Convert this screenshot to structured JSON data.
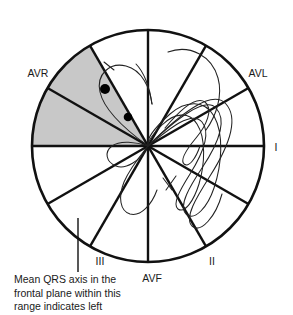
{
  "figure": {
    "type": "hexaxial-reference-diagram",
    "title_visible": false,
    "colors": {
      "line": "#111111",
      "shaded_wedge": "#c8c8c8",
      "trace": "#222222",
      "background": "#ffffff",
      "text": "#1a1a1a"
    },
    "circle": {
      "cx": 148,
      "cy": 146,
      "r": 116
    },
    "lead_labels": [
      {
        "id": "avr",
        "text": "AVR",
        "x": 38,
        "y": 77,
        "anchor": "middle",
        "degrees": 210
      },
      {
        "id": "avl",
        "text": "AVL",
        "x": 258,
        "y": 77,
        "anchor": "middle",
        "degrees": 330
      },
      {
        "id": "i",
        "text": "I",
        "x": 276,
        "y": 151,
        "anchor": "middle",
        "degrees": 0
      },
      {
        "id": "ii",
        "text": "II",
        "x": 212,
        "y": 265,
        "anchor": "middle",
        "degrees": 60
      },
      {
        "id": "iii",
        "text": "III",
        "x": 100,
        "y": 265,
        "anchor": "middle",
        "degrees": 120
      },
      {
        "id": "avf",
        "text": "AVF",
        "x": 152,
        "y": 282,
        "anchor": "middle",
        "degrees": 90
      }
    ],
    "axis_lines_degrees": [
      0,
      30,
      60,
      90,
      120,
      150
    ],
    "shaded_wedge": {
      "start_degrees": 180,
      "end_degrees": 240,
      "meaning": "left axis deviation range"
    },
    "markers": [
      {
        "id": "dot-1",
        "cx": 105,
        "cy": 89,
        "r": 5.0
      },
      {
        "id": "dot-2",
        "cx": 128,
        "cy": 117,
        "r": 4.3
      }
    ],
    "caption": {
      "lines": [
        "Mean QRS axis in the",
        "frontal plane within this",
        "range indicates left"
      ],
      "x": 14,
      "first_line_y": 283,
      "line_height": 13.5,
      "leader_line": {
        "x": 78,
        "y1": 218,
        "y2": 272
      }
    }
  }
}
